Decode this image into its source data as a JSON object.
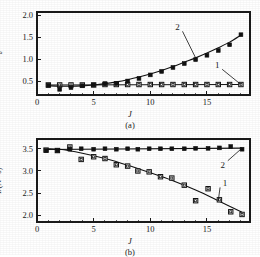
{
  "figure": {
    "panels": [
      {
        "id": "a",
        "caption": "(a)",
        "xlabel": "J",
        "ylabel_main": "t",
        "ylabel_sub": "d",
        "ylabel_unit": "/s",
        "ylabel_full": "t_d/s",
        "xticks": [
          "0",
          "5",
          "10",
          "15"
        ],
        "xtick_values": [
          0,
          5,
          10,
          15
        ],
        "yticks": [
          "0.5",
          "1.0",
          "1.5",
          "2.0"
        ],
        "ytick_values": [
          0.5,
          1.0,
          1.5,
          2.0
        ],
        "series_labels": [
          "1",
          "2"
        ]
      },
      {
        "id": "b",
        "caption": "(b)",
        "xlabel": "J",
        "ylabel_main": "I",
        "ylabel_unit": "/(N · s)",
        "ylabel_full": "I/(N · s)",
        "xticks": [
          "0",
          "5",
          "10",
          "15"
        ],
        "xtick_values": [
          0,
          5,
          10,
          15
        ],
        "yticks": [
          "2.0",
          "2.5",
          "3.0",
          "3.5"
        ],
        "ytick_values": [
          2.0,
          2.5,
          3.0,
          3.5
        ],
        "series_labels": [
          "1",
          "2"
        ]
      }
    ]
  },
  "chart_data": [
    {
      "type": "scatter",
      "panel": "a",
      "title": "",
      "xlabel": "J",
      "ylabel": "t_d/s",
      "xlim": [
        0,
        18.8
      ],
      "ylim": [
        0.18,
        2.08
      ],
      "grid": false,
      "legend": "inline-annotation",
      "series": [
        {
          "name": "1",
          "marker": "open-square",
          "label_position": {
            "x": 15.9,
            "y": 0.86
          },
          "x": [
            1,
            2,
            3,
            4,
            5,
            6,
            7,
            8,
            9,
            10,
            11,
            12,
            13,
            14,
            15,
            16,
            17,
            18
          ],
          "y": [
            0.41,
            0.41,
            0.41,
            0.41,
            0.41,
            0.42,
            0.42,
            0.42,
            0.42,
            0.42,
            0.42,
            0.42,
            0.42,
            0.42,
            0.42,
            0.42,
            0.42,
            0.42
          ],
          "fit_x": [
            1,
            18
          ],
          "fit_y": [
            0.41,
            0.42
          ]
        },
        {
          "name": "2",
          "marker": "filled-square",
          "label_position": {
            "x": 12.4,
            "y": 1.73
          },
          "x": [
            1,
            2,
            3,
            4,
            5,
            6,
            7,
            8,
            9,
            10,
            11,
            12,
            13,
            14,
            15,
            16,
            17,
            18
          ],
          "y": [
            0.4,
            0.31,
            0.35,
            0.39,
            0.41,
            0.44,
            0.45,
            0.5,
            0.56,
            0.64,
            0.72,
            0.81,
            0.9,
            0.99,
            1.09,
            1.2,
            1.33,
            1.56
          ],
          "fit_x": [
            1,
            2,
            3,
            4,
            5,
            6,
            7,
            8,
            9,
            10,
            11,
            12,
            13,
            14,
            15,
            16,
            17,
            18
          ],
          "fit_y": [
            0.39,
            0.38,
            0.38,
            0.39,
            0.41,
            0.44,
            0.48,
            0.53,
            0.59,
            0.66,
            0.74,
            0.83,
            0.93,
            1.03,
            1.14,
            1.26,
            1.39,
            1.55
          ]
        }
      ]
    },
    {
      "type": "scatter",
      "panel": "b",
      "title": "",
      "xlabel": "J",
      "ylabel": "I/(N · s)",
      "xlim": [
        0,
        18.8
      ],
      "ylim": [
        1.85,
        3.72
      ],
      "grid": false,
      "legend": "inline-annotation",
      "series": [
        {
          "name": "1",
          "marker": "open-square",
          "label_position": {
            "x": 16.6,
            "y": 2.72
          },
          "x": [
            0.8,
            1.8,
            2.9,
            3.9,
            5.0,
            6.0,
            7.0,
            8.0,
            8.9,
            9.9,
            10.9,
            11.9,
            13.0,
            14.0,
            15.1,
            16.1,
            17.1,
            18.1
          ],
          "y": [
            3.47,
            3.46,
            3.54,
            3.26,
            3.32,
            3.28,
            3.14,
            3.11,
            3.0,
            2.98,
            2.87,
            2.84,
            2.68,
            2.33,
            2.6,
            2.35,
            2.08,
            2.02
          ],
          "fit_x": [
            0.8,
            2,
            4,
            6,
            8,
            10,
            12,
            14,
            16,
            18.1
          ],
          "fit_y": [
            3.5,
            3.49,
            3.4,
            3.28,
            3.13,
            2.96,
            2.78,
            2.57,
            2.33,
            2.07
          ]
        },
        {
          "name": "2",
          "marker": "filled-square",
          "label_position": {
            "x": 16.4,
            "y": 3.14
          },
          "x": [
            0.8,
            1.8,
            2.9,
            3.9,
            5.0,
            6.0,
            7.0,
            8.0,
            8.9,
            9.9,
            10.9,
            11.9,
            13.0,
            14.0,
            15.1,
            16.1,
            17.1,
            18.1
          ],
          "y": [
            3.46,
            3.46,
            3.49,
            3.5,
            3.49,
            3.5,
            3.49,
            3.5,
            3.49,
            3.5,
            3.5,
            3.5,
            3.5,
            3.51,
            3.51,
            3.52,
            3.55,
            3.49
          ],
          "fit_x": [
            0.8,
            18.1
          ],
          "fit_y": [
            3.485,
            3.515
          ]
        }
      ]
    }
  ],
  "style": {
    "axis_color": "#1a1a1a",
    "marker_fill_open": "#ffffff",
    "marker_fill_solid": "#111111",
    "curve_color": "#111111",
    "background": "#ffffff"
  }
}
